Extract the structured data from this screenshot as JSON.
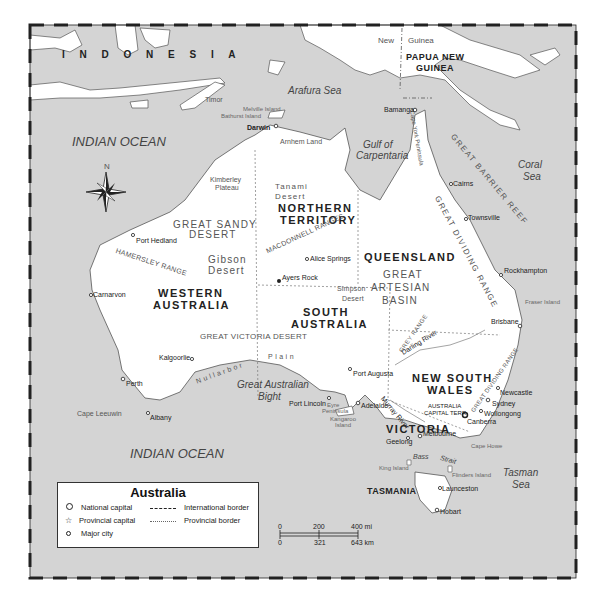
{
  "map": {
    "title": "Australia",
    "countries": {
      "indonesia": "I N D O N E S I A",
      "png_line1": "PAPUA NEW",
      "png_line2": "GUINEA",
      "new": "New",
      "guinea": "Guinea"
    },
    "oceans": {
      "indian_ocean_north": "INDIAN OCEAN",
      "indian_ocean_south": "INDIAN OCEAN"
    },
    "seas": {
      "arafura": "Arafura Sea",
      "gulf_line1": "Gulf of",
      "gulf_line2": "Carpentaria",
      "coral_line1": "Coral",
      "coral_line2": "Sea",
      "bight_line1": "Great Australian",
      "bight_line2": "Bight",
      "tasman_line1": "Tasman",
      "tasman_line2": "Sea",
      "bass": "Bass",
      "strait": "Strait"
    },
    "states": {
      "nt_line1": "NORTHERN",
      "nt_line2": "TERRITORY",
      "qld": "QUEENSLAND",
      "wa_line1": "WESTERN",
      "wa_line2": "AUSTRALIA",
      "sa_line1": "SOUTH",
      "sa_line2": "AUSTRALIA",
      "nsw_line1": "NEW SOUTH",
      "nsw_line2": "WALES",
      "vic": "VICTORIA",
      "tas": "TASMANIA",
      "act_line1": "AUSTRALIA",
      "act_line2": "CAPITAL TERR."
    },
    "regions": {
      "great_sandy_1": "GREAT SANDY",
      "great_sandy_2": "DESERT",
      "gibson_1": "Gibson",
      "gibson_2": "Desert",
      "tanami_1": "Tanami",
      "tanami_2": "Desert",
      "macdonnell": "MACDONNELL RANGES",
      "hamersley": "HAMERSLEY RANGE",
      "artesian_1": "GREAT",
      "artesian_2": "ARTESIAN",
      "artesian_3": "BASIN",
      "simpson_1": "Simpson",
      "simpson_2": "Desert",
      "great_victoria": "GREAT VICTORIA DESERT",
      "nullarbor": "Nullarbor",
      "plain": "Plain",
      "barrier_reef": "GREAT BARRIER REEF",
      "dividing_range": "GREAT DIVIDING RANGE",
      "dividing_range_south": "GREAT DIVIDING RANGE",
      "grey_range": "GREY RANGE",
      "kimberley_1": "Kimberley",
      "kimberley_2": "Plateau",
      "arnhem": "Arnhem Land",
      "cape_york": "Cape York Peninsula",
      "eyre_1": "Eyre",
      "eyre_2": "Peninsula",
      "darling": "Darling River",
      "murray": "Murray River",
      "timor": "Timor",
      "melville": "Melville Island",
      "bathurst": "Bathurst Island",
      "fraser": "Fraser Island",
      "kangaroo_1": "Kangaroo",
      "kangaroo_2": "Island",
      "king": "King Island",
      "flinders": "Flinders Island",
      "cape_leeuwin": "Cape Leeuwin",
      "cape_howe": "Cape Howe"
    },
    "cities": {
      "darwin": "Darwin",
      "bamanga": "Bamanga",
      "cairns": "Cairns",
      "townsville": "Townsville",
      "rockhampton": "Rockhampton",
      "brisbane": "Brisbane",
      "newcastle": "Newcastle",
      "sydney": "Sydney",
      "wollongong": "Wollongong",
      "canberra": "Canberra",
      "melbourne": "Melbourne",
      "geelong": "Geelong",
      "adelaide": "Adelaide",
      "port_augusta": "Port Augusta",
      "port_lincoln": "Port Lincoln",
      "alice_springs": "Alice Springs",
      "ayers_rock": "Ayers Rock",
      "port_hedland": "Port Hedland",
      "carnarvon": "Carnarvon",
      "kalgoorlie": "Kalgoorlie",
      "perth": "Perth",
      "albany": "Albany",
      "launceston": "Launceston",
      "hobart": "Hobart"
    },
    "compass": {
      "north": "N"
    }
  },
  "legend": {
    "title": "Australia",
    "items": [
      {
        "symbol": "national-capital",
        "label": "National capital"
      },
      {
        "symbol": "provincial-capital",
        "label": "Provincial capital"
      },
      {
        "symbol": "major-city",
        "label": "Major city"
      },
      {
        "symbol": "international-border",
        "label": "International border"
      },
      {
        "symbol": "provincial-border",
        "label": "Provincial border"
      }
    ]
  },
  "scale": {
    "mi": [
      "0",
      "200",
      "400 mi"
    ],
    "km": [
      "0",
      "321",
      "643 km"
    ]
  },
  "colors": {
    "water": "#d4d4d4",
    "land": "#ffffff",
    "frame": "#222222",
    "text": "#333333"
  }
}
